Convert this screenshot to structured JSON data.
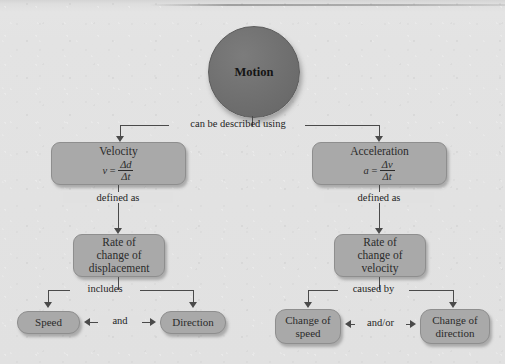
{
  "diagram": {
    "root": {
      "label": "Motion"
    },
    "colors": {
      "background": "#e1e1e1",
      "root_fill": "#6f6f6f",
      "node_fill": "#a9a9a9",
      "node_border": "#8e8e8e",
      "connector": "#4a4a4a",
      "text": "#1e1e1e"
    },
    "edge_labels": {
      "root_to_branches": "can be described using",
      "velocity_to_rate": "defined as",
      "acceleration_to_rate": "defined as",
      "displacement_includes": "includes",
      "velocity_components_join": "and",
      "velocity_caused_by": "caused by",
      "acceleration_components_join": "and/or"
    },
    "nodes": {
      "velocity": {
        "title": "Velocity",
        "formula": {
          "lhs": "v",
          "equals": "=",
          "numerator": "Δd",
          "denominator": "Δt"
        }
      },
      "acceleration": {
        "title": "Acceleration",
        "formula": {
          "lhs": "a",
          "equals": "=",
          "numerator": "Δv",
          "denominator": "Δt"
        }
      },
      "rate_displacement": {
        "line1": "Rate of",
        "line2": "change of",
        "line3": "displacement"
      },
      "rate_velocity": {
        "line1": "Rate of",
        "line2": "change of",
        "line3": "velocity"
      },
      "speed": {
        "label": "Speed"
      },
      "direction": {
        "label": "Direction"
      },
      "change_of_speed": {
        "line1": "Change of",
        "line2": "speed"
      },
      "change_of_direction": {
        "line1": "Change of",
        "line2": "direction"
      }
    }
  }
}
